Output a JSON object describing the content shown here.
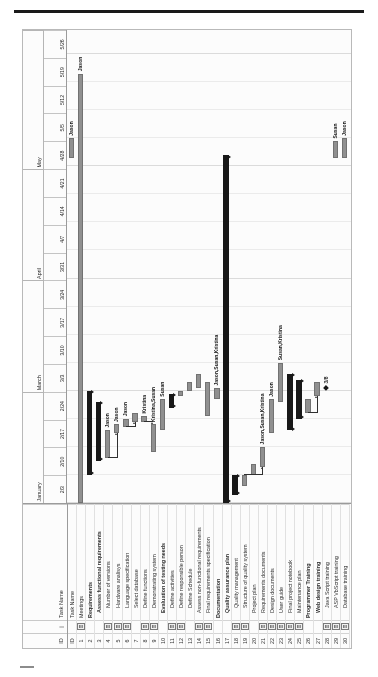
{
  "app": {
    "type": "gantt-chart",
    "columns": {
      "id": "ID",
      "indicator": "i",
      "task_name": "Task Name"
    }
  },
  "timeline": {
    "months": [
      {
        "label": "January",
        "weeks": 4
      },
      {
        "label": "March",
        "weeks": 4
      },
      {
        "label": "April",
        "weeks": 4
      },
      {
        "label": "May",
        "weeks": 5
      }
    ],
    "weeks": [
      "2/3",
      "2/10",
      "2/17",
      "2/24",
      "3/3",
      "3/10",
      "3/17",
      "3/24",
      "3/31",
      "4/7",
      "4/14",
      "4/21",
      "4/28",
      "5/5",
      "5/12",
      "5/19",
      "5/26"
    ]
  },
  "tasks": [
    {
      "id": "0",
      "name": "Task Name",
      "level": 0,
      "bold": false,
      "note": false
    },
    {
      "id": "1",
      "name": "Meetings",
      "level": 1,
      "bold": false,
      "note": true
    },
    {
      "id": "2",
      "name": "Requirements",
      "level": 1,
      "bold": true,
      "note": false
    },
    {
      "id": "3",
      "name": "Assess functional requirements",
      "level": 2,
      "bold": true,
      "note": false
    },
    {
      "id": "4",
      "name": "Number of versions",
      "level": 3,
      "bold": false,
      "note": true
    },
    {
      "id": "5",
      "name": "Hardware analisys",
      "level": 3,
      "bold": false,
      "note": true
    },
    {
      "id": "6",
      "name": "Language specification",
      "level": 3,
      "bold": false,
      "note": true
    },
    {
      "id": "7",
      "name": "Select database",
      "level": 3,
      "bold": false,
      "note": false
    },
    {
      "id": "8",
      "name": "Define functions",
      "level": 3,
      "bold": false,
      "note": true
    },
    {
      "id": "9",
      "name": "Demonstrating system",
      "level": 3,
      "bold": false,
      "note": true
    },
    {
      "id": "10",
      "name": "Evaluation of testing needs",
      "level": 2,
      "bold": true,
      "note": false
    },
    {
      "id": "11",
      "name": "Define activities",
      "level": 3,
      "bold": false,
      "note": true
    },
    {
      "id": "12",
      "name": "Define responsible person",
      "level": 3,
      "bold": false,
      "note": true
    },
    {
      "id": "13",
      "name": "Define Schedule",
      "level": 3,
      "bold": false,
      "note": false
    },
    {
      "id": "14",
      "name": "Assess non-functional requirements",
      "level": 2,
      "bold": false,
      "note": true
    },
    {
      "id": "15",
      "name": "Final requirements specification",
      "level": 2,
      "bold": false,
      "note": true
    },
    {
      "id": "16",
      "name": "Documentation",
      "level": 1,
      "bold": true,
      "note": false
    },
    {
      "id": "17",
      "name": "Quality assurance plan",
      "level": 2,
      "bold": true,
      "note": false
    },
    {
      "id": "18",
      "name": "Quality management",
      "level": 3,
      "bold": false,
      "note": true
    },
    {
      "id": "19",
      "name": "Structure of quality system",
      "level": 3,
      "bold": false,
      "note": true
    },
    {
      "id": "20",
      "name": "Project plan",
      "level": 2,
      "bold": false,
      "note": false
    },
    {
      "id": "21",
      "name": "Requirements documents",
      "level": 2,
      "bold": false,
      "note": true
    },
    {
      "id": "22",
      "name": "Design documents",
      "level": 2,
      "bold": false,
      "note": true
    },
    {
      "id": "23",
      "name": "User guide",
      "level": 2,
      "bold": false,
      "note": true
    },
    {
      "id": "24",
      "name": "Final project notebook",
      "level": 2,
      "bold": false,
      "note": true
    },
    {
      "id": "25",
      "name": "Maintenance plan",
      "level": 2,
      "bold": false,
      "note": true
    },
    {
      "id": "26",
      "name": "Programmer Training",
      "level": 1,
      "bold": true,
      "note": false
    },
    {
      "id": "27",
      "name": "Web design training",
      "level": 2,
      "bold": true,
      "note": false
    },
    {
      "id": "28",
      "name": "Java Script training",
      "level": 3,
      "bold": false,
      "note": true
    },
    {
      "id": "29",
      "name": "ASP VbScript training",
      "level": 3,
      "bold": false,
      "note": true
    },
    {
      "id": "30",
      "name": "Database training",
      "level": 3,
      "bold": false,
      "note": true
    }
  ],
  "chart_data": {
    "type": "bar",
    "xlabel": "",
    "ylabel": "",
    "categories": [
      "Meetings",
      "Requirements",
      "Assess functional requirements",
      "Number of versions",
      "Hardware analisys",
      "Language specification",
      "Select database",
      "Define functions",
      "Demonstrating system",
      "Evaluation of testing needs",
      "Define activities",
      "Define responsible person",
      "Define Schedule",
      "Assess non-functional requirements",
      "Final requirements specification",
      "Documentation",
      "Quality assurance plan",
      "Quality management",
      "Structure of quality system",
      "Project plan",
      "Requirements documents",
      "Design documents",
      "User guide",
      "Final project notebook",
      "Maintenance plan",
      "Programmer Training",
      "Web design training",
      "Java Script training",
      "ASP VbScript training",
      "Database training"
    ],
    "bars": [
      {
        "task_id": "1",
        "kind": "task",
        "start_week": 0.0,
        "end_week": 15.3,
        "resource": "Jason"
      },
      {
        "task_id": "2",
        "kind": "summary",
        "start_week": 1.0,
        "end_week": 4.0,
        "resource": ""
      },
      {
        "task_id": "3",
        "kind": "summary",
        "start_week": 1.5,
        "end_week": 3.6,
        "resource": ""
      },
      {
        "task_id": "4",
        "kind": "task",
        "start_week": 1.6,
        "end_week": 2.6,
        "resource": "Jason"
      },
      {
        "task_id": "5",
        "kind": "task",
        "start_week": 2.5,
        "end_week": 2.8,
        "resource": "Jason"
      },
      {
        "task_id": "6",
        "kind": "task",
        "start_week": 2.7,
        "end_week": 3.0,
        "resource": "Jason"
      },
      {
        "task_id": "7",
        "kind": "task",
        "start_week": 2.9,
        "end_week": 3.2,
        "resource": ""
      },
      {
        "task_id": "8",
        "kind": "task",
        "start_week": 2.9,
        "end_week": 3.1,
        "resource": "Kristina"
      },
      {
        "task_id": "9",
        "kind": "task",
        "start_week": 1.8,
        "end_week": 2.8,
        "resource": "Kristina,Susan"
      },
      {
        "task_id": "10",
        "kind": "task",
        "start_week": 2.6,
        "end_week": 3.7,
        "resource": "Susan"
      },
      {
        "task_id": "11",
        "kind": "summary",
        "start_week": 3.4,
        "end_week": 3.9,
        "resource": ""
      },
      {
        "task_id": "12",
        "kind": "task",
        "start_week": 3.8,
        "end_week": 4.0,
        "resource": ""
      },
      {
        "task_id": "13",
        "kind": "task",
        "start_week": 4.0,
        "end_week": 4.3,
        "resource": ""
      },
      {
        "task_id": "14",
        "kind": "task",
        "start_week": 4.1,
        "end_week": 4.6,
        "resource": ""
      },
      {
        "task_id": "15",
        "kind": "task",
        "start_week": 3.1,
        "end_week": 4.3,
        "resource": ""
      },
      {
        "task_id": "16",
        "kind": "task",
        "start_week": 3.7,
        "end_week": 4.1,
        "resource": "Jason,Susan,Kristina"
      },
      {
        "task_id": "17",
        "kind": "summary",
        "start_week": 0.0,
        "end_week": 12.4,
        "resource": ""
      },
      {
        "task_id": "18",
        "kind": "summary",
        "start_week": 0.3,
        "end_week": 1.0,
        "resource": ""
      },
      {
        "task_id": "19",
        "kind": "task",
        "start_week": 0.6,
        "end_week": 1.0,
        "resource": ""
      },
      {
        "task_id": "20",
        "kind": "task",
        "start_week": 1.0,
        "end_week": 1.4,
        "resource": ""
      },
      {
        "task_id": "21",
        "kind": "task",
        "start_week": 1.3,
        "end_week": 2.0,
        "resource": "Jason,Susan,Kristina"
      },
      {
        "task_id": "22",
        "kind": "task",
        "start_week": 2.5,
        "end_week": 3.7,
        "resource": "Jason"
      },
      {
        "task_id": "23",
        "kind": "task",
        "start_week": 3.6,
        "end_week": 5.0,
        "resource": "Susan,Kristina"
      },
      {
        "task_id": "24",
        "kind": "summary",
        "start_week": 2.6,
        "end_week": 4.6,
        "resource": ""
      },
      {
        "task_id": "25",
        "kind": "summary",
        "start_week": 3.0,
        "end_week": 4.4,
        "resource": ""
      },
      {
        "task_id": "26",
        "kind": "task",
        "start_week": 3.2,
        "end_week": 3.7,
        "resource": ""
      },
      {
        "task_id": "27",
        "kind": "task",
        "start_week": 3.8,
        "end_week": 4.3,
        "resource": ""
      },
      {
        "task_id": "28",
        "kind": "milestone",
        "start_week": 4.1,
        "end_week": 4.1,
        "resource": "3/8"
      },
      {
        "task_id": "29",
        "kind": "task",
        "start_week": 12.3,
        "end_week": 12.9,
        "resource": "Susan"
      },
      {
        "task_id": "30",
        "kind": "task",
        "start_week": 12.3,
        "end_week": 13.0,
        "resource": "Jason"
      },
      {
        "task_id": "31",
        "kind": "task",
        "start_week": 12.3,
        "end_week": 13.0,
        "resource": "Jason"
      }
    ]
  }
}
